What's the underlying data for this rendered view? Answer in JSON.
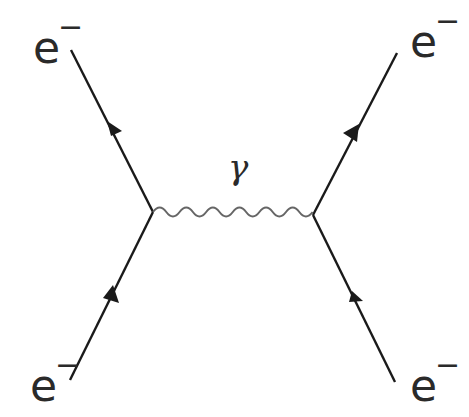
{
  "diagram": {
    "type": "feynman",
    "title": "",
    "particles": {
      "top_left": {
        "symbol": "e",
        "charge": "−"
      },
      "top_right": {
        "symbol": "e",
        "charge": "−"
      },
      "bottom_left": {
        "symbol": "e",
        "charge": "−"
      },
      "bottom_right": {
        "symbol": "e",
        "charge": "−"
      }
    },
    "propagator": {
      "symbol": "γ"
    },
    "colors": {
      "fermion_line": "#1a1a1a",
      "photon_line": "#666666",
      "text": "#2a2a2a"
    }
  }
}
